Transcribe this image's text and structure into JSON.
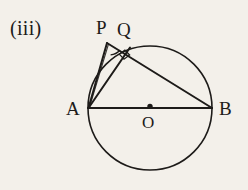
{
  "figure": {
    "part_label": "(iii)",
    "background_color": "#f3f0ea",
    "ink_color": "#1d1b19",
    "labels": {
      "P": "P",
      "Q": "Q",
      "A": "A",
      "B": "B",
      "O": "O"
    },
    "circle": {
      "center_x": 150,
      "center_y": 108,
      "radius": 62
    },
    "points": {
      "A": [
        88,
        108
      ],
      "B": [
        212,
        108
      ],
      "O": [
        150,
        108
      ],
      "P": [
        108,
        42
      ],
      "Q": [
        126,
        50
      ]
    },
    "segments": [
      {
        "name": "AB",
        "from": "A",
        "to": "B"
      },
      {
        "name": "AP",
        "from": "A",
        "to": "P"
      },
      {
        "name": "AQ",
        "from": "A",
        "to": "Q"
      },
      {
        "name": "PB",
        "from": "P",
        "to": "B"
      }
    ],
    "angle_markers": [
      {
        "name": "angle-at-P",
        "type": "arc"
      },
      {
        "name": "right-angle-at-Q",
        "type": "square"
      }
    ]
  }
}
